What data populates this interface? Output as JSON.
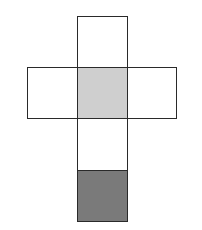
{
  "diagram": {
    "type": "cube-net",
    "stroke_color": "#2a2a2a",
    "faces": [
      {
        "id": "top",
        "x": 77,
        "y": 16,
        "w": 51,
        "h": 52,
        "fill": "#ffffff",
        "shaded": false
      },
      {
        "id": "left",
        "x": 27,
        "y": 67,
        "w": 51,
        "h": 52,
        "fill": "#ffffff",
        "shaded": false
      },
      {
        "id": "center",
        "x": 77,
        "y": 67,
        "w": 51,
        "h": 52,
        "fill": "#cfcfcf",
        "shaded": true
      },
      {
        "id": "right",
        "x": 127,
        "y": 67,
        "w": 50,
        "h": 52,
        "fill": "#ffffff",
        "shaded": false
      },
      {
        "id": "lower",
        "x": 77,
        "y": 118,
        "w": 51,
        "h": 53,
        "fill": "#ffffff",
        "shaded": false
      },
      {
        "id": "bottom",
        "x": 77,
        "y": 170,
        "w": 51,
        "h": 52,
        "fill": "#7a7a7a",
        "shaded": true
      }
    ]
  }
}
